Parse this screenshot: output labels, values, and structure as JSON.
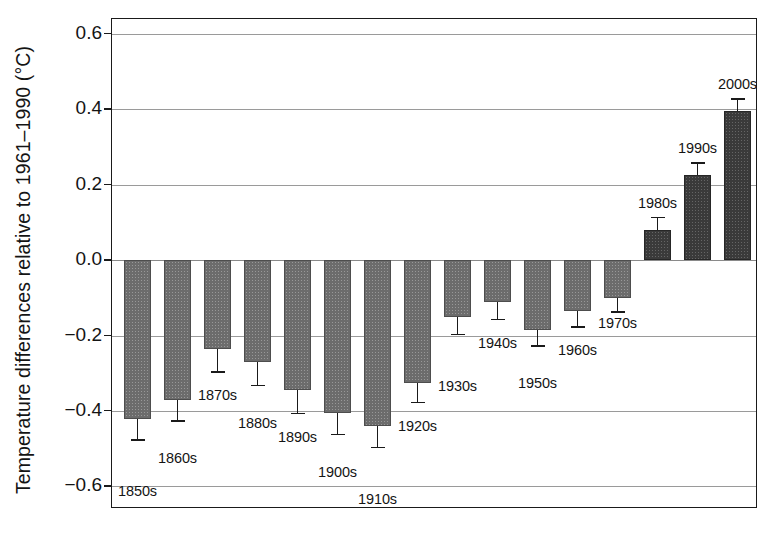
{
  "chart_data": {
    "type": "bar",
    "title": "",
    "xlabel": "",
    "ylabel": "Temperature differences relative to 1961–1990 (°C)",
    "ylim": [
      -0.6,
      0.6
    ],
    "ytick_labels": [
      "0.6",
      "0.4",
      "0.2",
      "0.0",
      "−0.2",
      "−0.4",
      "−0.6"
    ],
    "ytick_values": [
      0.6,
      0.4,
      0.2,
      0.0,
      -0.2,
      -0.4,
      -0.6
    ],
    "grid": "horizontal",
    "legend": "none",
    "categories": [
      "1850s",
      "1860s",
      "1870s",
      "1880s",
      "1890s",
      "1900s",
      "1910s",
      "1920s",
      "1930s",
      "1940s",
      "1950s",
      "1960s",
      "1970s",
      "1980s",
      "1990s",
      "2000s"
    ],
    "values": [
      -0.42,
      -0.37,
      -0.235,
      -0.27,
      -0.345,
      -0.405,
      -0.44,
      -0.325,
      -0.15,
      -0.11,
      -0.185,
      -0.135,
      -0.1,
      0.08,
      0.225,
      0.395
    ],
    "errors": [
      0.055,
      0.055,
      0.06,
      0.06,
      0.06,
      0.055,
      0.055,
      0.05,
      0.045,
      0.045,
      0.04,
      0.04,
      0.035,
      0.035,
      0.035,
      0.035
    ],
    "label_offsets_px": [
      40,
      26,
      12,
      26,
      12,
      26,
      40,
      12,
      40,
      12,
      26,
      12,
      0,
      -60,
      -60,
      -60
    ],
    "bar_colors": {
      "negative": "#6c6c6c",
      "positive": "#3a3a3a"
    },
    "axis_color": "#1a1a1a",
    "grid_color": "#9a9a9a"
  }
}
